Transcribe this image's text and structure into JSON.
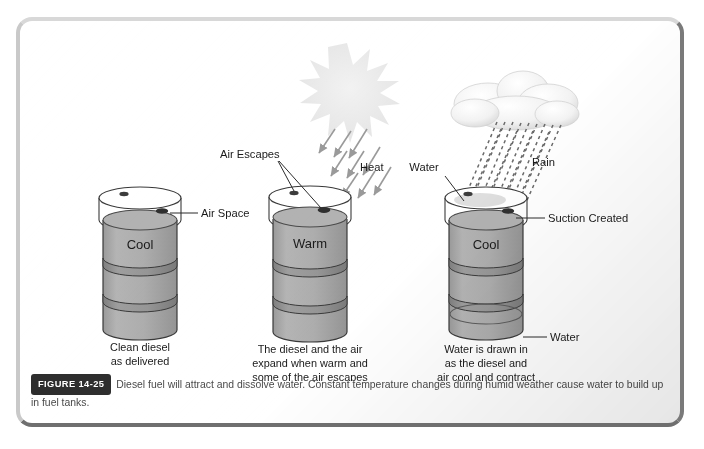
{
  "figure": {
    "badge": "FIGURE 14-25",
    "caption": "Diesel fuel will attract and dissolve water. Constant temperature changes during humid weather cause water to build up in fuel tanks."
  },
  "colors": {
    "drum_body": "#a9a9a9",
    "drum_band": "#8d8d8d",
    "drum_outline": "#3a3a3a",
    "sun": "#eaeaea",
    "cloud": "#f4f4f4",
    "rain": "#6e6e6e",
    "heat_arrow": "#9a9a9a",
    "badge_bg": "#2e2e2e",
    "frame": "#b5b5b5"
  },
  "panels": [
    {
      "id": "panel-cool-clean",
      "drum_label": "Cool",
      "caption_lines": [
        "Clean diesel",
        "as delivered"
      ],
      "callouts": [
        {
          "name": "air-space",
          "text": "Air Space"
        }
      ]
    },
    {
      "id": "panel-warm-expand",
      "drum_label": "Warm",
      "caption_lines": [
        "The diesel and the air",
        "expand when warm and",
        "some of the air escapes"
      ],
      "callouts": [
        {
          "name": "air-escapes",
          "text": "Air Escapes"
        },
        {
          "name": "heat",
          "text": "Heat"
        }
      ],
      "weather": "sun"
    },
    {
      "id": "panel-cool-contract",
      "drum_label": "Cool",
      "caption_lines": [
        "Water is drawn in",
        "as the diesel and",
        "air cool and contract"
      ],
      "callouts": [
        {
          "name": "water-top",
          "text": "Water"
        },
        {
          "name": "rain",
          "text": "Rain"
        },
        {
          "name": "suction-created",
          "text": "Suction Created"
        },
        {
          "name": "water-bottom",
          "text": "Water"
        }
      ],
      "weather": "cloud-rain"
    }
  ]
}
